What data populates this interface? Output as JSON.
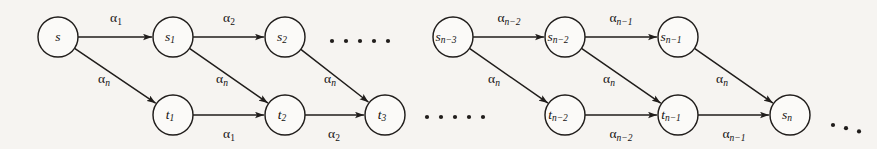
{
  "figure": {
    "type": "directed-graph-diagram",
    "background_color": "#f6f4f1",
    "ink_color": "#201d1b",
    "node_radius": 20,
    "node_fill": "#fbfaf8"
  },
  "nodes": [
    {
      "id": "s",
      "base": "s",
      "sub": "",
      "x": 58,
      "y": 37,
      "group": "left",
      "row": "top"
    },
    {
      "id": "s1",
      "base": "s",
      "sub": "1",
      "x": 173,
      "y": 37,
      "group": "left",
      "row": "top"
    },
    {
      "id": "s2",
      "base": "s",
      "sub": "2",
      "x": 285,
      "y": 37,
      "group": "left",
      "row": "top"
    },
    {
      "id": "t1",
      "base": "t",
      "sub": "1",
      "x": 173,
      "y": 115,
      "group": "left",
      "row": "bottom"
    },
    {
      "id": "t2",
      "base": "t",
      "sub": "2",
      "x": 285,
      "y": 115,
      "group": "left",
      "row": "bottom"
    },
    {
      "id": "t3",
      "base": "t",
      "sub": "3",
      "x": 385,
      "y": 115,
      "group": "left",
      "row": "bottom"
    },
    {
      "id": "sn3",
      "base": "s",
      "sub": "n−3",
      "x": 453,
      "y": 37,
      "group": "right",
      "row": "top"
    },
    {
      "id": "sn2",
      "base": "s",
      "sub": "n−2",
      "x": 565,
      "y": 37,
      "group": "right",
      "row": "top"
    },
    {
      "id": "sn1",
      "base": "s",
      "sub": "n−1",
      "x": 678,
      "y": 37,
      "group": "right",
      "row": "top"
    },
    {
      "id": "tn2",
      "base": "t",
      "sub": "n−2",
      "x": 565,
      "y": 115,
      "group": "right",
      "row": "bottom"
    },
    {
      "id": "tn1",
      "base": "t",
      "sub": "n−1",
      "x": 678,
      "y": 115,
      "group": "right",
      "row": "bottom"
    },
    {
      "id": "sn",
      "base": "s",
      "sub": "n",
      "x": 790,
      "y": 115,
      "group": "right",
      "row": "bottom"
    }
  ],
  "edges": [
    {
      "id": "e-s-s1",
      "from": "s",
      "to": "s1",
      "base": "α",
      "sub": "1",
      "lx": 116,
      "ly": 19,
      "kind": "horizontal-top"
    },
    {
      "id": "e-s1-s2",
      "from": "s1",
      "to": "s2",
      "base": "α",
      "sub": "2",
      "lx": 229,
      "ly": 19,
      "kind": "horizontal-top"
    },
    {
      "id": "e-s-t1",
      "from": "s",
      "to": "t1",
      "base": "α",
      "sub": "n",
      "lx": 104,
      "ly": 80,
      "kind": "diagonal"
    },
    {
      "id": "e-s1-t2",
      "from": "s1",
      "to": "t2",
      "base": "α",
      "sub": "n",
      "lx": 222,
      "ly": 80,
      "kind": "diagonal"
    },
    {
      "id": "e-s2-t3",
      "from": "s2",
      "to": "t3",
      "base": "α",
      "sub": "n",
      "lx": 330,
      "ly": 80,
      "kind": "diagonal"
    },
    {
      "id": "e-t1-t2",
      "from": "t1",
      "to": "t2",
      "base": "α",
      "sub": "1",
      "lx": 229,
      "ly": 135,
      "kind": "horizontal-bottom"
    },
    {
      "id": "e-t2-t3",
      "from": "t2",
      "to": "t3",
      "base": "α",
      "sub": "2",
      "lx": 334,
      "ly": 135,
      "kind": "horizontal-bottom"
    },
    {
      "id": "e-sn3-sn2",
      "from": "sn3",
      "to": "sn2",
      "base": "α",
      "sub": "n−2",
      "lx": 509,
      "ly": 19,
      "kind": "horizontal-top"
    },
    {
      "id": "e-sn2-sn1",
      "from": "sn2",
      "to": "sn1",
      "base": "α",
      "sub": "n−1",
      "lx": 621,
      "ly": 19,
      "kind": "horizontal-top"
    },
    {
      "id": "e-sn3-tn2",
      "from": "sn3",
      "to": "tn2",
      "base": "α",
      "sub": "n",
      "lx": 494,
      "ly": 80,
      "kind": "diagonal"
    },
    {
      "id": "e-sn2-tn1",
      "from": "sn2",
      "to": "tn1",
      "base": "α",
      "sub": "n",
      "lx": 609,
      "ly": 80,
      "kind": "diagonal"
    },
    {
      "id": "e-sn1-sn",
      "from": "sn1",
      "to": "sn",
      "base": "α",
      "sub": "n",
      "lx": 722,
      "ly": 80,
      "kind": "diagonal"
    },
    {
      "id": "e-tn2-tn1",
      "from": "tn2",
      "to": "tn1",
      "base": "α",
      "sub": "n−2",
      "lx": 621,
      "ly": 135,
      "kind": "horizontal-bottom"
    },
    {
      "id": "e-tn1-sn",
      "from": "tn1",
      "to": "sn",
      "base": "α",
      "sub": "n−1",
      "lx": 734,
      "ly": 135,
      "kind": "horizontal-bottom"
    }
  ],
  "ellipses": [
    {
      "id": "ellipsis-top-left",
      "count": 5,
      "x": 332,
      "y": 41,
      "spacing": 14,
      "radius": 2.1
    },
    {
      "id": "ellipsis-bottom-right",
      "count": 5,
      "x": 427,
      "y": 117,
      "spacing": 14,
      "radius": 2.1
    },
    {
      "id": "ellipsis-trailing",
      "count": 3,
      "x": 833,
      "y": 125,
      "spacing": 13,
      "radius": 2.1
    }
  ]
}
